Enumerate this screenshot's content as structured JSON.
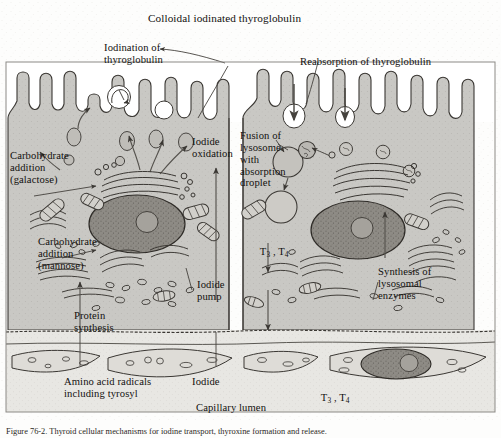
{
  "figure": {
    "title": "Colloidal iodinated thyroglobulin",
    "caption": "Figure 76-2.  Thyroid cellular mechanisms for iodine transport, thyroxine formation and release.",
    "colors": {
      "background": "#fdfdfc",
      "cytoplasm": "#c9c8c4",
      "colloid": "#ffffff",
      "nucleus": "#8e8b85",
      "ink": "#12100e",
      "stipple": "#b9b7b2",
      "capillary": "#e6e5e1"
    }
  },
  "labels": {
    "top_title": "Colloidal iodinated thyroglobulin",
    "iodination": "Iodination of\nthyroglobulin",
    "reabsorption": "Reabsorption of thyroglobulin",
    "iodide_oxidation": "Iodide\noxidation",
    "carb_galactose": "Carbohydrate\naddition\n(galactose)",
    "carb_mannose": "Carbohydrate\naddition\n(mannose)",
    "protein_synthesis": "Protein\nsynthesis",
    "iodide_pump": "Iodide\npump",
    "fusion": "Fusion of\nlysosome\nwith\nabsorption\ndroplet",
    "lysosomal_synthesis": "Synthesis of\nlysosomal\nenzymes",
    "t3t4_cell": "T3 , T4",
    "t3t4_blood": "T3 , T4",
    "amino_acids": "Amino acid radicals\nincluding tyrosyl",
    "iodide": "Iodide",
    "capillary_lumen": "Capillary lumen",
    "t3_base": "T",
    "t3_sub": "3",
    "t4_base": "T",
    "t4_sub": "4",
    "t_sep": " , "
  },
  "structures": {
    "cells": [
      "left-follicular-cell",
      "right-follicular-cell"
    ],
    "organelles": [
      "microvilli",
      "nucleus",
      "nucleolus",
      "golgi-apparatus",
      "rough-endoplasmic-reticulum",
      "mitochondria",
      "lysosome",
      "absorption-droplet",
      "secretory-vesicle",
      "colloid-droplet"
    ],
    "capillary_cells": [
      "endothelial-cell-1",
      "endothelial-cell-2",
      "endothelial-cell-3",
      "endothelial-cell-nucleated"
    ]
  },
  "icons": {
    "arrow": "arrow-icon",
    "pinocytosis_arrow": "downward-pinocytosis-arrow-icon",
    "pointer": "leader-line-icon"
  }
}
